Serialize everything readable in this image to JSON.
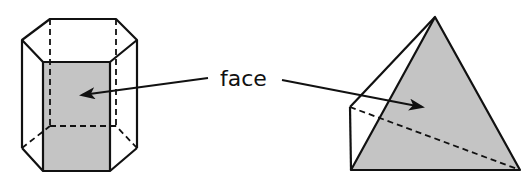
{
  "diagram": {
    "label": "face",
    "colors": {
      "stroke": "#111111",
      "face_fill": "#c4c4c4",
      "background": "#ffffff"
    },
    "shapes": [
      {
        "name": "hexagonal-prism",
        "highlighted": "front rectangular face"
      },
      {
        "name": "triangular-pyramid",
        "highlighted": "front triangular face"
      }
    ],
    "arrows": [
      {
        "from": "label",
        "to": "hexagonal-prism face"
      },
      {
        "from": "label",
        "to": "triangular-pyramid face"
      }
    ]
  }
}
